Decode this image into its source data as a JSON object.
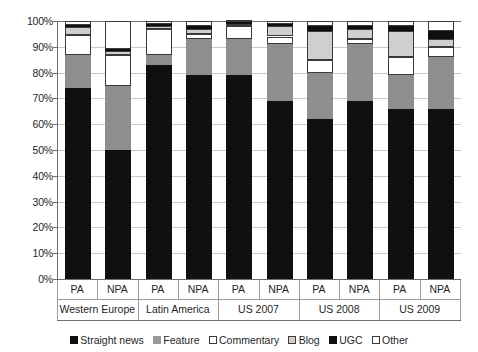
{
  "chart_data": {
    "type": "bar",
    "stacked": true,
    "stack_total": 100,
    "title": "",
    "subtitle": "",
    "xlabel": "",
    "ylabel": "",
    "ylim": [
      0,
      100
    ],
    "grid": true,
    "legend_position": "bottom",
    "ytick_labels": [
      "100%",
      "90%",
      "80%",
      "70%",
      "60%",
      "50%",
      "40%",
      "30%",
      "20%",
      "10%",
      "0%"
    ],
    "ytick_values": [
      100,
      90,
      80,
      70,
      60,
      50,
      40,
      30,
      20,
      10,
      0
    ],
    "groups": [
      {
        "label": "Western Europe",
        "subcategories": [
          "PA",
          "NPA"
        ]
      },
      {
        "label": "Latin America",
        "subcategories": [
          "PA",
          "NPA"
        ]
      },
      {
        "label": "US 2007",
        "subcategories": [
          "PA",
          "NPA"
        ]
      },
      {
        "label": "US 2008",
        "subcategories": [
          "PA",
          "NPA"
        ]
      },
      {
        "label": "US 2009",
        "subcategories": [
          "PA",
          "NPA"
        ]
      }
    ],
    "categories": [
      "Western Europe PA",
      "Western Europe NPA",
      "Latin America PA",
      "Latin America NPA",
      "US 2007 PA",
      "US 2007 NPA",
      "US 2008 PA",
      "US 2008 NPA",
      "US 2009 PA",
      "US 2009 NPA"
    ],
    "series": [
      {
        "name": "Straight news",
        "color": "#101010",
        "values": [
          74,
          50,
          83,
          79,
          79,
          69,
          62,
          69,
          66,
          66
        ]
      },
      {
        "name": "Feature",
        "color": "#8e8e8e",
        "values": [
          13,
          25,
          4,
          14,
          14,
          22,
          18,
          22,
          13,
          20
        ]
      },
      {
        "name": "Commentary",
        "color": "#ffffff",
        "values": [
          7.5,
          12,
          10,
          2,
          5,
          3,
          5,
          2,
          7,
          4
        ]
      },
      {
        "name": "Blog",
        "color": "#cfcfcf",
        "values": [
          3,
          1.5,
          1,
          2,
          1,
          4,
          11,
          4,
          10,
          3
        ]
      },
      {
        "name": "UGC",
        "color": "#101010",
        "values": [
          1,
          0.5,
          1,
          1,
          0.5,
          1,
          2,
          1,
          2,
          3
        ]
      },
      {
        "name": "Other",
        "color": "#ffffff",
        "values": [
          1.5,
          11,
          1,
          2,
          0.5,
          1,
          2,
          2,
          2,
          4
        ]
      }
    ]
  },
  "legend": {
    "items": [
      {
        "label": "Straight news",
        "swatch": "swatch-straight-news"
      },
      {
        "label": "Feature",
        "swatch": "swatch-feature"
      },
      {
        "label": "Commentary",
        "swatch": "swatch-commentary"
      },
      {
        "label": "Blog",
        "swatch": "swatch-blog"
      },
      {
        "label": "UGC",
        "swatch": "swatch-ugc"
      },
      {
        "label": "Other",
        "swatch": "swatch-other"
      }
    ]
  }
}
